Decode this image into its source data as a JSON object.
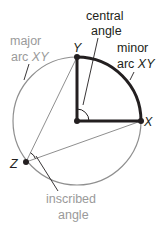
{
  "diagram": {
    "labels": {
      "central_angle_line1": "central",
      "central_angle_line2": "angle",
      "minor_arc_line1": "minor",
      "minor_arc_line2_prefix": "arc ",
      "minor_arc_line2_name": "XY",
      "major_arc_line1": "major",
      "major_arc_line2_prefix": "arc ",
      "major_arc_line2_name": "XY",
      "inscribed_angle_line1": "inscribed",
      "inscribed_angle_line2": "angle"
    },
    "points": {
      "Y": "Y",
      "X": "X",
      "Z": "Z"
    },
    "colors": {
      "dark": "#231f20",
      "gray": "#9a9a9a",
      "circle": "#8f8f8f"
    }
  }
}
